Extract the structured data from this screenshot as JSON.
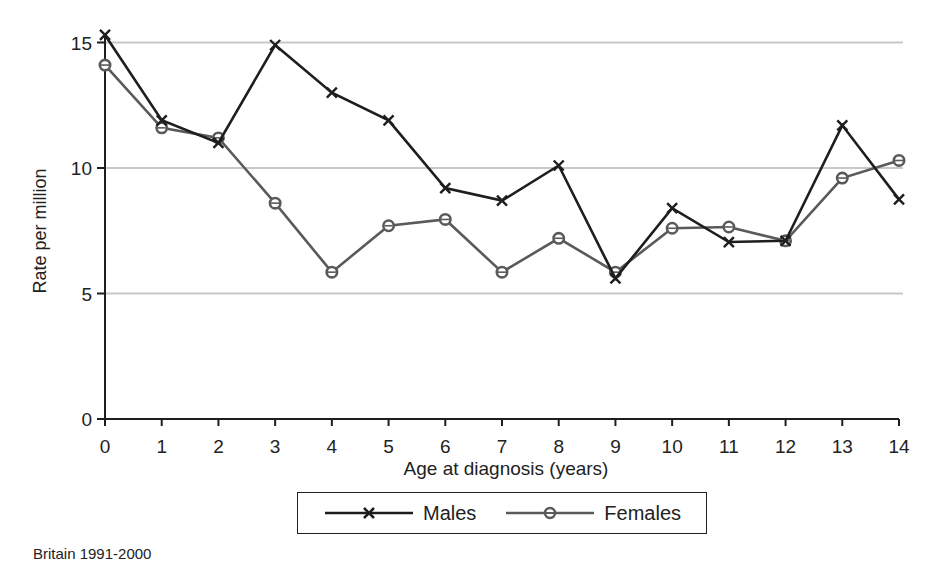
{
  "chart_data": {
    "type": "line",
    "title": "",
    "xlabel": "Age at diagnosis (years)",
    "ylabel": "Rate per million",
    "x": [
      0,
      1,
      2,
      3,
      4,
      5,
      6,
      7,
      8,
      9,
      10,
      11,
      12,
      13,
      14
    ],
    "xticks": [
      "0",
      "1",
      "2",
      "3",
      "4",
      "5",
      "6",
      "7",
      "8",
      "9",
      "10",
      "11",
      "12",
      "13",
      "14"
    ],
    "yticks": [
      "0",
      "5",
      "10",
      "15"
    ],
    "ylim": [
      0,
      15.5
    ],
    "xlim": [
      0,
      14
    ],
    "grid": "horizontal at 5, 10, 15",
    "legend_position": "bottom center",
    "series": [
      {
        "name": "Males",
        "marker": "x",
        "color": "#1e1e1e",
        "values": [
          15.3,
          11.9,
          11.0,
          14.9,
          13.0,
          11.9,
          9.2,
          8.7,
          10.1,
          5.6,
          8.4,
          7.05,
          7.1,
          11.7,
          8.75
        ]
      },
      {
        "name": "Females",
        "marker": "o",
        "color": "#5a5a5a",
        "values": [
          14.1,
          11.6,
          11.2,
          8.6,
          5.85,
          7.7,
          7.95,
          5.85,
          7.2,
          5.85,
          7.6,
          7.65,
          7.1,
          9.6,
          10.3
        ]
      }
    ],
    "annotation": "Britain 1991-2000"
  },
  "legend": {
    "males_label": "Males",
    "females_label": "Females"
  },
  "footnote": "Britain 1991-2000",
  "colors": {
    "axis": "#1e1e1e",
    "grid": "#c8c8c8",
    "males": "#1e1e1e",
    "females": "#5a5a5a"
  }
}
